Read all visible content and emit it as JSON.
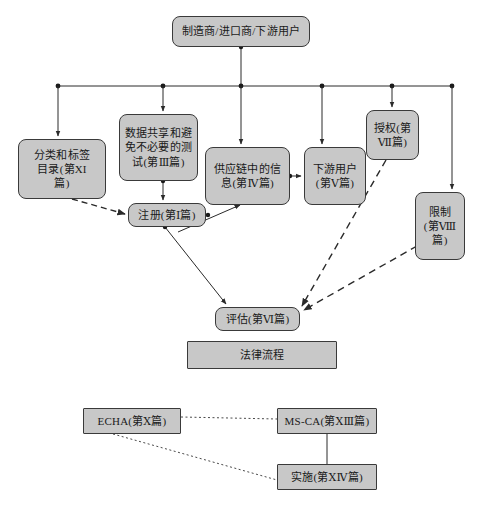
{
  "diagram": {
    "background_color": "#ffffff",
    "node_fill": "#c8c8c8",
    "node_stroke": "#3a3a3a",
    "nodes": [
      {
        "id": "manufacturer",
        "label": "制造商/进口商/下游用户",
        "shape": "rounded",
        "x": 172,
        "y": 16,
        "w": 138,
        "h": 31,
        "font_size": 11
      },
      {
        "id": "classification",
        "label": "分类和标签\n目录(第XI\n篇)",
        "shape": "rounded",
        "x": 18,
        "y": 139,
        "w": 88,
        "h": 60,
        "font_size": 11
      },
      {
        "id": "data_sharing",
        "label": "数据共享和避\n免不必要的测\n试(第Ⅲ篇)",
        "shape": "rounded",
        "x": 119,
        "y": 114,
        "w": 79,
        "h": 67,
        "font_size": 11
      },
      {
        "id": "supply_chain",
        "label": "供应链中的信\n息(第Ⅳ篇)",
        "shape": "rounded",
        "x": 205,
        "y": 147,
        "w": 85,
        "h": 58,
        "font_size": 11
      },
      {
        "id": "downstream",
        "label": "下游用户\n(第Ⅴ篇)",
        "shape": "rounded",
        "x": 304,
        "y": 147,
        "w": 62,
        "h": 58,
        "font_size": 11
      },
      {
        "id": "authorisation",
        "label": "授权(第\nⅦ篇)",
        "shape": "rounded",
        "x": 366,
        "y": 110,
        "w": 53,
        "h": 50,
        "font_size": 11
      },
      {
        "id": "restriction",
        "label": "限制\n(第Ⅷ\n篇)",
        "shape": "rounded",
        "x": 415,
        "y": 192,
        "w": 50,
        "h": 68,
        "font_size": 11
      },
      {
        "id": "registration",
        "label": "注册(第Ⅰ篇)",
        "shape": "rounded",
        "x": 128,
        "y": 203,
        "w": 78,
        "h": 24,
        "font_size": 11
      },
      {
        "id": "evaluation",
        "label": "评估(第Ⅵ篇)",
        "shape": "rounded",
        "x": 215,
        "y": 307,
        "w": 85,
        "h": 24,
        "font_size": 11
      },
      {
        "id": "legal_process",
        "label": "法律流程",
        "shape": "square",
        "x": 187,
        "y": 341,
        "w": 150,
        "h": 28,
        "font_size": 11
      },
      {
        "id": "echa",
        "label": "ECHA(第Ⅹ篇)",
        "shape": "square",
        "x": 83,
        "y": 408,
        "w": 98,
        "h": 26,
        "font_size": 11
      },
      {
        "id": "msca",
        "label": "MS-CA(第ⅩⅢ篇)",
        "shape": "square",
        "x": 277,
        "y": 408,
        "w": 100,
        "h": 26,
        "font_size": 11
      },
      {
        "id": "implementation",
        "label": "实施(第ⅩⅣ篇)",
        "shape": "square",
        "x": 277,
        "y": 464,
        "w": 100,
        "h": 26,
        "font_size": 11
      }
    ],
    "bus_line": {
      "y": 86,
      "x_start": 58,
      "x_end": 452
    },
    "junction_dots": [
      58,
      163,
      241,
      322,
      392,
      452
    ],
    "edges": [
      {
        "from": "manufacturer",
        "to": "bus",
        "style": "solid"
      },
      {
        "from": "bus",
        "to": "classification",
        "style": "solid"
      },
      {
        "from": "bus",
        "to": "data_sharing",
        "style": "solid"
      },
      {
        "from": "bus",
        "to": "supply_chain",
        "style": "solid"
      },
      {
        "from": "bus",
        "to": "downstream",
        "style": "solid"
      },
      {
        "from": "bus",
        "to": "authorisation",
        "style": "solid"
      },
      {
        "from": "bus",
        "to": "restriction",
        "style": "solid"
      },
      {
        "from": "data_sharing",
        "to": "registration",
        "style": "solid"
      },
      {
        "from": "supply_chain",
        "to": "registration",
        "style": "solid"
      },
      {
        "from": "supply_chain",
        "to": "downstream",
        "style": "solid"
      },
      {
        "from": "registration",
        "to": "supply_chain",
        "style": "solid"
      },
      {
        "from": "registration",
        "to": "evaluation",
        "style": "solid"
      },
      {
        "from": "classification",
        "to": "registration",
        "style": "dashed"
      },
      {
        "from": "authorisation",
        "to": "evaluation",
        "style": "dashed"
      },
      {
        "from": "restriction",
        "to": "evaluation",
        "style": "dashed"
      },
      {
        "from": "echa",
        "to": "msca",
        "style": "dotted"
      },
      {
        "from": "msca",
        "to": "implementation",
        "style": "solid"
      },
      {
        "from": "echa",
        "to": "implementation",
        "style": "dotted"
      }
    ]
  }
}
